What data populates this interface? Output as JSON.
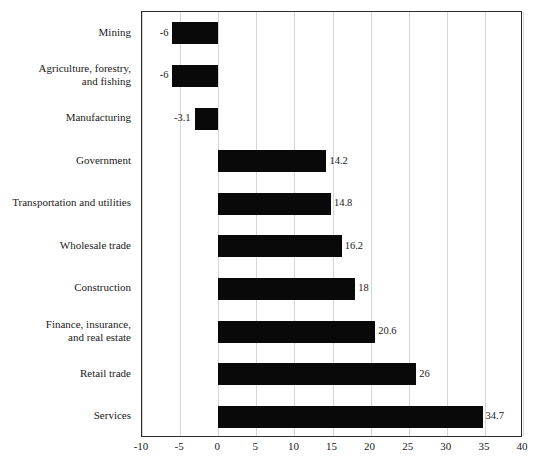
{
  "chart_data": {
    "type": "bar",
    "orientation": "horizontal",
    "title": "",
    "subtitle": "",
    "xlabel": "",
    "ylabel": "",
    "categories": [
      "Mining",
      "Agriculture, forestry,\nand fishing",
      "Manufacturing",
      "Government",
      "Transportation and utilities",
      "Wholesale trade",
      "Construction",
      "Finance, insurance,\nand real estate",
      "Retail trade",
      "Services"
    ],
    "values": [
      -6,
      -6,
      -3.1,
      14.2,
      14.8,
      16.2,
      18,
      20.6,
      26,
      34.7
    ],
    "data_labels": [
      "-6",
      "-6",
      "-3.1",
      "14.2",
      "14.8",
      "16.2",
      "18",
      "20.6",
      "26",
      "34.7"
    ],
    "xlim": [
      -10,
      40
    ],
    "xticks": [
      -10,
      -5,
      0,
      5,
      10,
      15,
      20,
      25,
      30,
      35,
      40
    ],
    "xtick_labels": [
      "-10",
      "-5",
      "0",
      "5",
      "10",
      "15",
      "20",
      "25",
      "30",
      "35",
      "40"
    ],
    "grid": true,
    "grid_axis": "x",
    "legend": null,
    "bar_color": "#090909",
    "grid_color": "#d6d6d6",
    "frame_color": "#2b2b2b",
    "background_color": "#ffffff"
  }
}
